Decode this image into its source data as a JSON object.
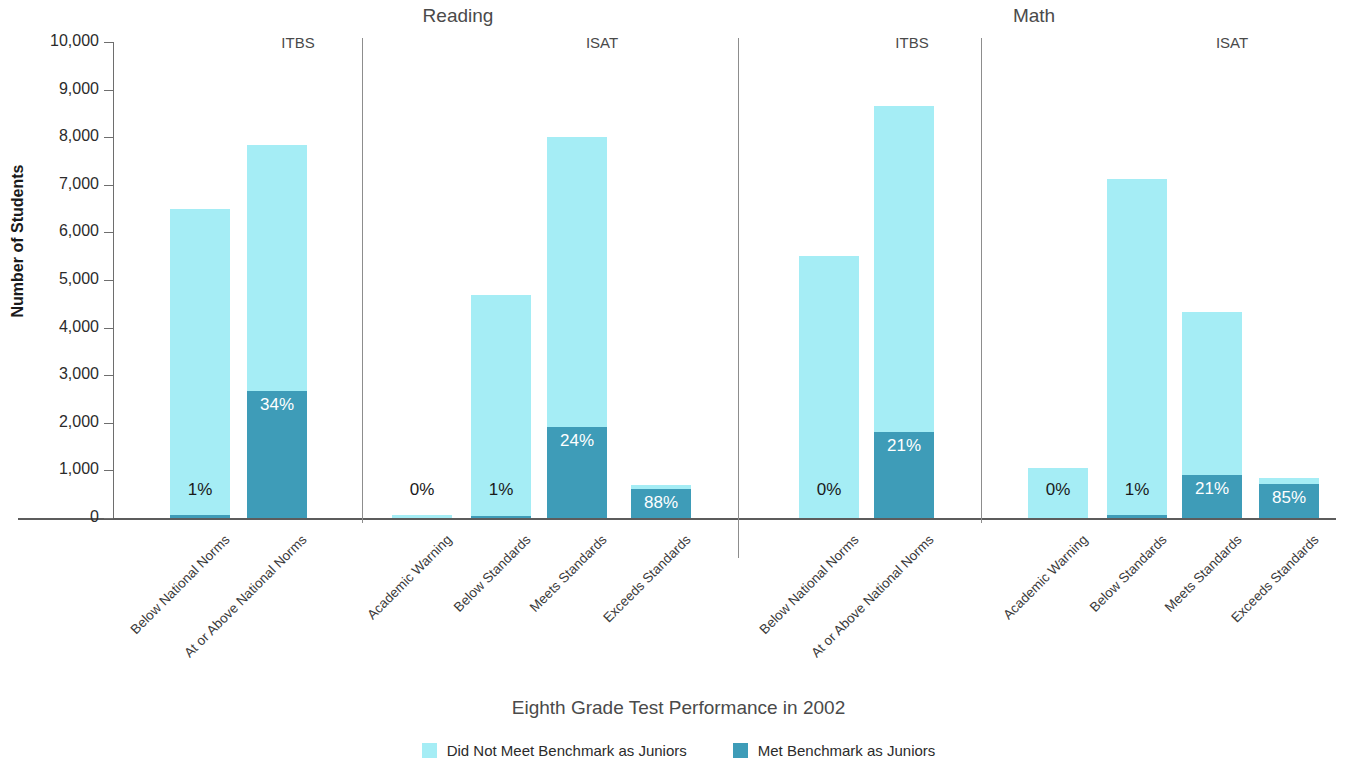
{
  "chart_data": {
    "type": "bar",
    "title": "",
    "xlabel": "Eighth Grade Test Performance in 2002",
    "ylabel": "Number of Students",
    "ylim": [
      0,
      10000
    ],
    "ytick_labels": [
      "10,000",
      "9,000",
      "8,000",
      "7,000",
      "6,000",
      "5,000",
      "4,000",
      "3,000",
      "2,000",
      "1,000",
      "0"
    ],
    "ytick_values": [
      10000,
      9000,
      8000,
      7000,
      6000,
      5000,
      4000,
      3000,
      2000,
      1000,
      0
    ],
    "grid": false,
    "stacked": true,
    "legend_position": "bottom",
    "series": [
      {
        "name": "Did Not Meet Benchmark as Juniors",
        "color": "#a5edf5",
        "values": [
          6435,
          5168,
          70,
          4633,
          6080,
          84,
          5500,
          6833,
          1050,
          7049,
          3421,
          126
        ]
      },
      {
        "name": "Met Benchmark as Juniors",
        "color": "#3e9cb8",
        "values": [
          65,
          2662,
          0,
          47,
          1920,
          616,
          0,
          1817,
          0,
          71,
          909,
          714
        ]
      }
    ],
    "categories": [
      "Below National Norms",
      "At or Above National Norms",
      "Academic Warning",
      "Below Standards",
      "Meets Standards",
      "Exceeds Standards",
      "Below National Norms",
      "At or Above National Norms",
      "Academic Warning",
      "Below Standards",
      "Meets Standards",
      "Exceeds Standards"
    ],
    "totals": [
      6500,
      7830,
      70,
      4680,
      8000,
      700,
      5500,
      8650,
      1050,
      7120,
      4330,
      840
    ],
    "pct_labels": [
      "1%",
      "34%",
      "0%",
      "1%",
      "24%",
      "88%",
      "0%",
      "21%",
      "0%",
      "1%",
      "21%",
      "85%"
    ],
    "groups": [
      {
        "label": "Reading",
        "subgroups": [
          {
            "label": "ITBS",
            "bar_indices": [
              0,
              1
            ]
          },
          {
            "label": "ISAT",
            "bar_indices": [
              2,
              3,
              4,
              5
            ]
          }
        ]
      },
      {
        "label": "Math",
        "subgroups": [
          {
            "label": "ITBS",
            "bar_indices": [
              6,
              7
            ]
          },
          {
            "label": "ISAT",
            "bar_indices": [
              8,
              9,
              10,
              11
            ]
          }
        ]
      }
    ]
  },
  "colors": {
    "light": "#a5edf5",
    "dark": "#3e9cb8",
    "axis": "#5c5c5c",
    "divider": "#8d8d8d",
    "text": "#3a3a3a"
  }
}
